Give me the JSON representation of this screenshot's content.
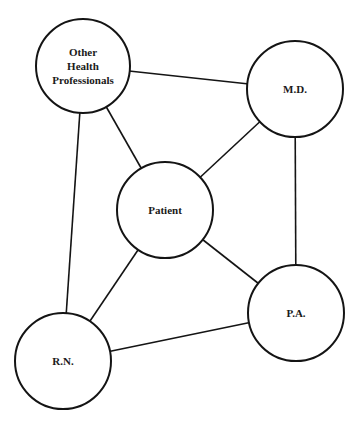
{
  "diagram": {
    "type": "network",
    "nodes": [
      {
        "id": "ohp",
        "label_lines": [
          "Other",
          "Health",
          "Professionals"
        ],
        "cx": 83,
        "cy": 66,
        "r": 47
      },
      {
        "id": "md",
        "label_lines": [
          "M.D."
        ],
        "cx": 295,
        "cy": 89,
        "r": 48
      },
      {
        "id": "patient",
        "label_lines": [
          "Patient"
        ],
        "cx": 165,
        "cy": 210,
        "r": 48
      },
      {
        "id": "rn",
        "label_lines": [
          "R.N."
        ],
        "cx": 63,
        "cy": 361,
        "r": 48
      },
      {
        "id": "pa",
        "label_lines": [
          "P.A."
        ],
        "cx": 296,
        "cy": 313,
        "r": 48
      }
    ],
    "edges": [
      {
        "from": "ohp",
        "to": "md"
      },
      {
        "from": "ohp",
        "to": "patient"
      },
      {
        "from": "ohp",
        "to": "rn"
      },
      {
        "from": "md",
        "to": "patient"
      },
      {
        "from": "md",
        "to": "pa"
      },
      {
        "from": "patient",
        "to": "rn"
      },
      {
        "from": "patient",
        "to": "pa"
      },
      {
        "from": "rn",
        "to": "pa"
      }
    ]
  }
}
